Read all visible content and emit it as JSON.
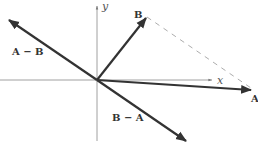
{
  "diagram": {
    "type": "vector-diagram",
    "axes": {
      "x_label": "x",
      "y_label": "y"
    },
    "vectors": [
      {
        "name": "A",
        "label": "A"
      },
      {
        "name": "B",
        "label": "B"
      },
      {
        "name": "A-B",
        "label": "A − B"
      },
      {
        "name": "B-A",
        "label": "B − A"
      }
    ],
    "connector": "dashed line from tip of B to tip of A",
    "colors": {
      "vector": "#333333",
      "axis": "#777777",
      "dashed": "#888888"
    }
  }
}
